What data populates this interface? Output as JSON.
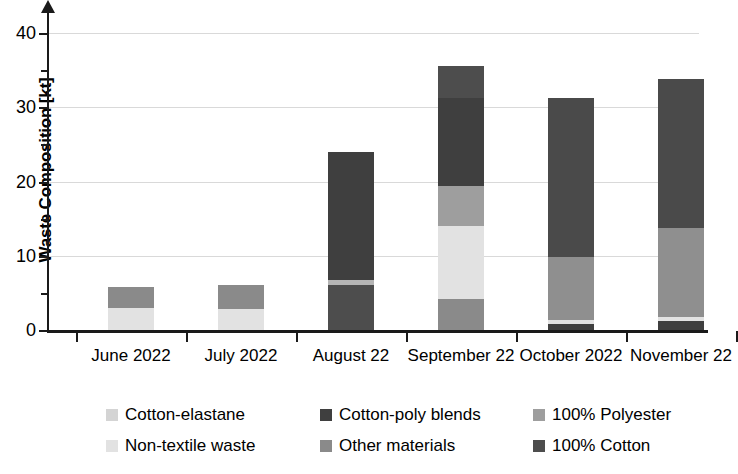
{
  "chart_data": {
    "type": "bar",
    "subtype": "stacked-bar",
    "title": "",
    "xlabel": "",
    "ylabel": "Waste Composition [kt]",
    "ylim": [
      0,
      44
    ],
    "yticks_major": [
      0,
      10,
      20,
      30,
      40
    ],
    "yticks_minor": [
      5,
      15,
      25,
      35
    ],
    "ytick_labels": [
      "0",
      "10",
      "20",
      "30",
      "40"
    ],
    "grid": true,
    "grid_axis": "y",
    "legend_position": "bottom",
    "legend_columns": 3,
    "categories": [
      "June 2022",
      "July 2022",
      "August 22",
      "September 22",
      "October 2022",
      "November 22"
    ],
    "series": [
      {
        "name": "Cotton-elastane",
        "color": "#d4d4d4",
        "values": [
          0,
          0,
          0,
          0,
          0,
          0
        ]
      },
      {
        "name": "Non-textile waste",
        "color": "#e2e2e2",
        "values": [
          2.9,
          2.8,
          0,
          9.8,
          0.6,
          0.5
        ]
      },
      {
        "name": "Cotton-poly blends",
        "color": "#3f3f3f",
        "values": [
          0,
          0,
          17.3,
          11.9,
          20.7,
          19.9
        ]
      },
      {
        "name": "Other materials",
        "color": "#8a8a8a",
        "values": [
          2.9,
          3.2,
          0,
          4.3,
          0,
          0
        ]
      },
      {
        "name": "100% Polyester",
        "color": "#9e9e9e",
        "values": [
          0,
          0,
          0.6,
          5.4,
          8.5,
          12.3
        ]
      },
      {
        "name": "100% Cotton",
        "color": "#4d4d4d",
        "values": [
          0,
          0,
          6.1,
          4.2,
          1.5,
          1.1
        ]
      }
    ],
    "stack_order": [
      "100% Cotton",
      "Non-textile waste",
      "100% Polyester",
      "Other materials",
      "Cotton-poly blends",
      "Cotton-elastane"
    ],
    "bar_totals": [
      5.8,
      6.0,
      24.0,
      35.6,
      31.3,
      33.8
    ],
    "stacks": [
      {
        "category": "June 2022",
        "segments": [
          {
            "name": "Non-textile waste",
            "value": 2.9,
            "color": "#e2e2e2"
          },
          {
            "name": "Other materials",
            "value": 2.9,
            "color": "#8a8a8a"
          }
        ],
        "total": 5.8
      },
      {
        "category": "July 2022",
        "segments": [
          {
            "name": "Non-textile waste",
            "value": 2.8,
            "color": "#e2e2e2"
          },
          {
            "name": "Other materials",
            "value": 3.2,
            "color": "#8a8a8a"
          }
        ],
        "total": 6.0
      },
      {
        "category": "August 22",
        "segments": [
          {
            "name": "100% Cotton",
            "value": 6.1,
            "color": "#4d4d4d"
          },
          {
            "name": "100% Polyester",
            "value": 0.6,
            "color": "#b5b5b5"
          },
          {
            "name": "Cotton-poly blends",
            "value": 17.3,
            "color": "#3f3f3f"
          }
        ],
        "total": 24.0
      },
      {
        "category": "September 22",
        "segments": [
          {
            "name": "100% Cotton",
            "value": 4.2,
            "color": "#8a8a8a"
          },
          {
            "name": "Non-textile waste",
            "value": 9.8,
            "color": "#e2e2e2"
          },
          {
            "name": "100% Polyester",
            "value": 5.4,
            "color": "#9e9e9e"
          },
          {
            "name": "Cotton-poly blends",
            "value": 11.9,
            "color": "#3f3f3f"
          },
          {
            "name": "Cotton-elastane",
            "value": 4.3,
            "color": "#4d4d4d"
          }
        ],
        "total": 35.6
      },
      {
        "category": "October 2022",
        "segments": [
          {
            "name": "100% Cotton",
            "value": 0.8,
            "color": "#3f3f3f"
          },
          {
            "name": "Non-textile waste",
            "value": 0.6,
            "color": "#e2e2e2"
          },
          {
            "name": "100% Polyester",
            "value": 8.5,
            "color": "#8f8f8f"
          },
          {
            "name": "Cotton-poly blends",
            "value": 21.4,
            "color": "#4a4a4a"
          }
        ],
        "total": 31.3
      },
      {
        "category": "November 22",
        "segments": [
          {
            "name": "100% Cotton",
            "value": 1.2,
            "color": "#3f3f3f"
          },
          {
            "name": "Non-textile waste",
            "value": 0.5,
            "color": "#e2e2e2"
          },
          {
            "name": "100% Polyester",
            "value": 12.1,
            "color": "#8f8f8f"
          },
          {
            "name": "Cotton-poly blends",
            "value": 20.0,
            "color": "#4a4a4a"
          }
        ],
        "total": 33.8
      }
    ]
  },
  "legend": {
    "items": [
      {
        "label": "Cotton-elastane",
        "color": "#d4d4d4"
      },
      {
        "label": "Cotton-poly blends",
        "color": "#3f3f3f"
      },
      {
        "label": "100% Polyester",
        "color": "#9e9e9e"
      },
      {
        "label": "Non-textile waste",
        "color": "#e2e2e2"
      },
      {
        "label": "Other materials",
        "color": "#8a8a8a"
      },
      {
        "label": "100% Cotton",
        "color": "#4d4d4d"
      }
    ]
  }
}
